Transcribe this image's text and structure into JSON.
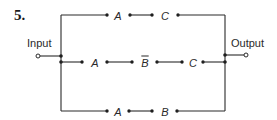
{
  "problem": {
    "number": "5."
  },
  "labels": {
    "input": "Input",
    "output": "Output"
  },
  "branches": [
    {
      "name": "top",
      "switches": [
        {
          "label": "A",
          "negated": false
        },
        {
          "label": "C",
          "negated": false
        }
      ]
    },
    {
      "name": "middle",
      "switches": [
        {
          "label": "A",
          "negated": false
        },
        {
          "label": "B",
          "negated": true
        },
        {
          "label": "C",
          "negated": false
        }
      ]
    },
    {
      "name": "bottom",
      "switches": [
        {
          "label": "A",
          "negated": false
        },
        {
          "label": "B",
          "negated": false
        }
      ]
    }
  ],
  "colors": {
    "wire": "#2a2a2a",
    "background": "#ffffff"
  }
}
